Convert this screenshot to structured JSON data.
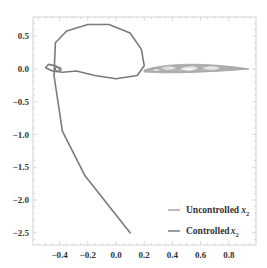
{
  "chart_data": {
    "type": "line",
    "title": "",
    "xlabel": "",
    "ylabel": "",
    "xlim": [
      -0.58,
      0.98
    ],
    "ylim": [
      -2.68,
      0.78
    ],
    "grid": false,
    "legend_position": "lower right",
    "x_ticks": [
      -0.4,
      -0.2,
      0.0,
      0.2,
      0.4,
      0.6,
      0.8
    ],
    "x_tick_labels": [
      "−0.4",
      "−0.2",
      "0.0",
      "0.2",
      "0.4",
      "0.6",
      "0.8"
    ],
    "y_ticks": [
      0.5,
      0.0,
      -0.5,
      -1.0,
      -1.5,
      -2.0,
      -2.5
    ],
    "y_tick_labels": [
      "0.5",
      "0.0",
      "−0.5",
      "−1.0",
      "−1.5",
      "−2.0",
      "−2.5"
    ],
    "series": [
      {
        "name": "Uncontrolled x2",
        "legend_text": "Uncontrolled",
        "legend_var": "x",
        "legend_sub": "2",
        "color": "#a6a6a6",
        "description": "dense chaotic band forming an elongated spindle near y=0, spanning x from about 0.2 to 0.93",
        "x": [
          0.2,
          0.35,
          0.5,
          0.65,
          0.8,
          0.93,
          0.8,
          0.65,
          0.5,
          0.35,
          0.2
        ],
        "y": [
          0.0,
          0.06,
          0.08,
          0.07,
          0.04,
          0.0,
          -0.02,
          -0.03,
          -0.04,
          -0.04,
          0.0
        ]
      },
      {
        "name": "Controlled x2",
        "legend_text": "Controlled",
        "legend_var": "x",
        "legend_sub": "2",
        "color": "#7a7a7a",
        "x": [
          0.1,
          -0.22,
          -0.38,
          -0.44,
          -0.43,
          -0.35,
          -0.2,
          -0.05,
          0.1,
          0.18,
          0.2,
          0.15,
          0.0,
          -0.15,
          -0.28,
          -0.38,
          -0.45,
          -0.5,
          -0.48,
          -0.43,
          -0.4
        ],
        "y": [
          -2.5,
          -1.63,
          -0.95,
          -0.1,
          0.4,
          0.58,
          0.68,
          0.68,
          0.55,
          0.3,
          0.05,
          -0.1,
          -0.15,
          -0.1,
          -0.03,
          -0.05,
          -0.03,
          0.02,
          0.07,
          0.05,
          0.0
        ]
      }
    ]
  }
}
